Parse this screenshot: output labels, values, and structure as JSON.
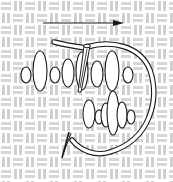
{
  "diagram": {
    "title": "Bullion-style stitch worked on evenweave fabric",
    "width": 173,
    "height": 182,
    "colors": {
      "background": "#ffffff",
      "fabric_thread": "#d9d9d9",
      "fabric_edge": "#bdbdbd",
      "outline": "#1a1a1a",
      "fill": "#ffffff"
    },
    "fabric": {
      "pattern": "basket-weave",
      "cell": 12
    },
    "arrow": {
      "label": "direction-of-work",
      "x1": 43,
      "y1": 23,
      "x2": 124,
      "y2": 23
    },
    "stitch_rows": [
      {
        "name": "upper-row",
        "ovals": [
          {
            "cx": 26,
            "cy": 75,
            "rx": 5,
            "ry": 8
          },
          {
            "cx": 40,
            "cy": 71,
            "rx": 7,
            "ry": 20
          },
          {
            "cx": 55,
            "cy": 75,
            "rx": 5,
            "ry": 8
          },
          {
            "cx": 68,
            "cy": 73,
            "rx": 6,
            "ry": 14
          },
          {
            "cx": 82,
            "cy": 71,
            "rx": 6,
            "ry": 19
          },
          {
            "cx": 97,
            "cy": 74,
            "rx": 6,
            "ry": 13
          },
          {
            "cx": 112,
            "cy": 71,
            "rx": 7,
            "ry": 20
          },
          {
            "cx": 128,
            "cy": 75,
            "rx": 5,
            "ry": 8
          }
        ]
      },
      {
        "name": "lower-row",
        "ovals": [
          {
            "cx": 89,
            "cy": 114,
            "rx": 6,
            "ry": 14
          },
          {
            "cx": 99,
            "cy": 117,
            "rx": 4,
            "ry": 7
          },
          {
            "cx": 106,
            "cy": 115,
            "rx": 5,
            "ry": 12
          },
          {
            "cx": 113,
            "cy": 113,
            "rx": 6,
            "ry": 22
          },
          {
            "cx": 122,
            "cy": 115,
            "rx": 5,
            "ry": 13
          },
          {
            "cx": 131,
            "cy": 117,
            "rx": 4,
            "ry": 7
          }
        ]
      }
    ],
    "needle": {
      "label": "needle",
      "eye": {
        "x": 87,
        "y": 46
      }
    },
    "thread": {
      "label": "working-thread"
    },
    "loose_needle": {
      "label": "needle-tip-below"
    }
  }
}
